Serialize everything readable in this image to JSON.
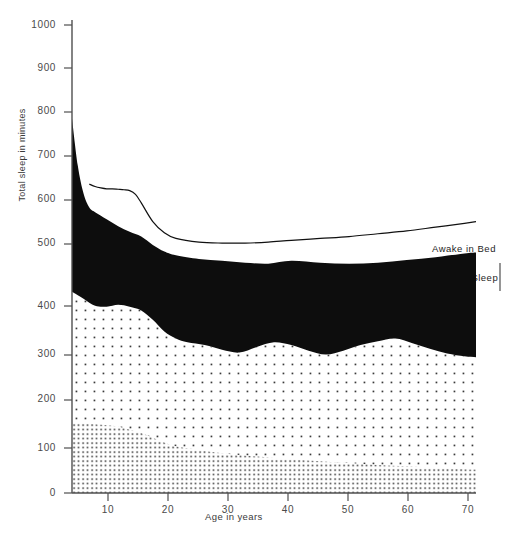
{
  "chart_data": {
    "type": "area",
    "title": "",
    "xlabel": "Age in years",
    "ylabel": "Total sleep in minutes",
    "xlim": [
      2,
      72
    ],
    "ylim": [
      0,
      1000
    ],
    "xticks": [
      10,
      20,
      30,
      40,
      50,
      60,
      70
    ],
    "yticks": [
      0,
      100,
      200,
      300,
      400,
      500,
      600,
      700,
      800,
      900,
      1000
    ],
    "grid": false,
    "legend_position": "inline-annotations",
    "stacking": "cumulative-from-zero",
    "series": [
      {
        "name": "Delta Sleep",
        "fill": "dense-dot-stipple",
        "x": [
          2,
          5,
          8,
          10,
          12,
          14,
          16,
          18,
          20,
          24,
          28,
          32,
          36,
          40,
          45,
          50,
          55,
          60,
          65,
          70,
          72
        ],
        "values": [
          150,
          148,
          145,
          142,
          135,
          128,
          118,
          108,
          100,
          92,
          85,
          80,
          76,
          72,
          68,
          64,
          60,
          57,
          54,
          51,
          50
        ]
      },
      {
        "name": "Stage 2 Sleep",
        "fill": "sparse-dot-stipple",
        "x": [
          2,
          4,
          6,
          8,
          10,
          12,
          14,
          16,
          18,
          20,
          22,
          25,
          28,
          31,
          34,
          37,
          40,
          43,
          46,
          49,
          52,
          55,
          58,
          61,
          64,
          67,
          70,
          72
        ],
        "values": [
          430,
          415,
          400,
          398,
          402,
          398,
          390,
          370,
          345,
          330,
          322,
          316,
          306,
          300,
          312,
          322,
          316,
          304,
          296,
          304,
          316,
          324,
          330,
          320,
          308,
          298,
          292,
          290
        ]
      },
      {
        "name": "Stage 1 Sleep",
        "fill": "solid-black",
        "x": [
          2,
          3,
          4,
          5,
          6,
          8,
          10,
          12,
          14,
          16,
          18,
          20,
          24,
          28,
          32,
          36,
          40,
          45,
          50,
          55,
          60,
          65,
          70,
          72
        ],
        "values": [
          800,
          700,
          640,
          610,
          600,
          585,
          570,
          558,
          548,
          530,
          516,
          508,
          500,
          496,
          492,
          490,
          496,
          492,
          490,
          492,
          498,
          504,
          512,
          514
        ]
      },
      {
        "name": "Awake in Bed",
        "fill": "white-with-outline",
        "x": [
          5,
          6,
          7,
          8,
          9,
          10,
          11,
          12,
          13,
          14,
          16,
          18,
          20,
          24,
          28,
          32,
          36,
          40,
          45,
          50,
          55,
          60,
          65,
          70,
          72
        ],
        "values": [
          660,
          655,
          652,
          650,
          650,
          649,
          648,
          646,
          638,
          620,
          580,
          556,
          544,
          536,
          534,
          534,
          536,
          540,
          544,
          548,
          554,
          560,
          568,
          576,
          580
        ]
      }
    ],
    "annotations": [
      {
        "id": "awake-in-bed",
        "text": "Awake in Bed",
        "x_px": 432,
        "y_px": 243
      },
      {
        "id": "stage-1-sleep",
        "text": "Stage 1 Sleep",
        "x_px": 432,
        "y_px": 272
      },
      {
        "id": "stage-2-sleep",
        "text": "Stage 2 Sleep",
        "x_px": 112,
        "y_px": 370
      },
      {
        "id": "delta-sleep",
        "text": "Delta Sleep",
        "x_px": 112,
        "y_px": 455
      }
    ]
  },
  "axes": {
    "y_title": "Total sleep in minutes",
    "x_title": "Age in years",
    "y_labels": [
      "1000",
      "900",
      "800",
      "700",
      "600",
      "500",
      "400",
      "300",
      "200",
      "100",
      "0"
    ],
    "x_labels": [
      "10",
      "20",
      "30",
      "40",
      "50",
      "60",
      "70"
    ]
  },
  "colors": {
    "stage1_fill": "#0d0d0d",
    "stage2_fill": "#ffffff",
    "delta_fill": "#ffffff",
    "stipple_dot": "#3a3a3a",
    "axis_line": "#4f4f4f",
    "curve_line": "#111111",
    "text": "#2b2b2b",
    "background": "#ffffff"
  }
}
